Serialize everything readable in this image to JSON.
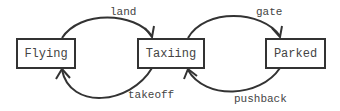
{
  "diagram": {
    "type": "state-machine",
    "states": [
      {
        "id": "flying",
        "label": "Flying"
      },
      {
        "id": "taxiing",
        "label": "Taxiing"
      },
      {
        "id": "parked",
        "label": "Parked"
      }
    ],
    "transitions": [
      {
        "from": "flying",
        "to": "taxiing",
        "label": "land"
      },
      {
        "from": "taxiing",
        "to": "flying",
        "label": "takeoff"
      },
      {
        "from": "taxiing",
        "to": "parked",
        "label": "gate"
      },
      {
        "from": "parked",
        "to": "taxiing",
        "label": "pushback"
      }
    ],
    "colors": {
      "stroke": "#333333",
      "text": "#444444"
    }
  }
}
